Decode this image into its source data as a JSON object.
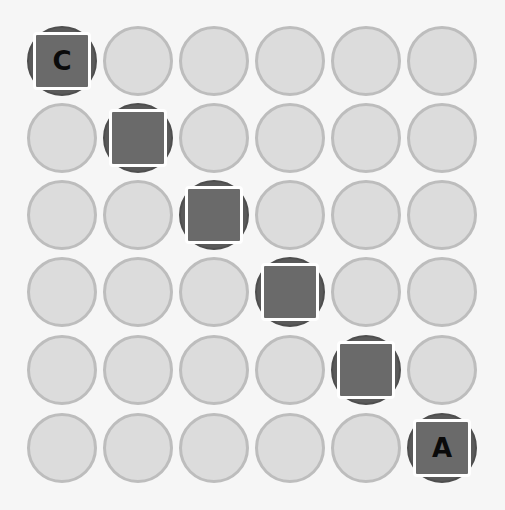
{
  "board": {
    "rows": 6,
    "cols": 6,
    "col_x": [
      62,
      138,
      214,
      290,
      366,
      442
    ],
    "row_y": [
      61,
      138,
      215,
      292,
      370,
      448
    ],
    "colors": {
      "background": "#f6f6f6",
      "empty_fill": "#dcdcdc",
      "empty_border": "#bdbdbd",
      "active_circle": "#5a5a5a",
      "tile_fill": "#6a6a6a",
      "tile_border": "#ffffff",
      "letter": "#0a0a0a"
    },
    "active_cells": [
      {
        "row": 0,
        "col": 0,
        "letter": "C"
      },
      {
        "row": 1,
        "col": 1,
        "letter": ""
      },
      {
        "row": 2,
        "col": 2,
        "letter": ""
      },
      {
        "row": 3,
        "col": 3,
        "letter": ""
      },
      {
        "row": 4,
        "col": 4,
        "letter": ""
      },
      {
        "row": 5,
        "col": 5,
        "letter": "A"
      }
    ]
  }
}
